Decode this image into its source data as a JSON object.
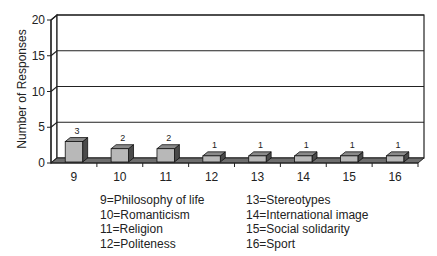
{
  "chart_data": {
    "type": "bar",
    "style": "3d-column",
    "title": "",
    "xlabel": "",
    "ylabel": "Number of Responses",
    "ylim": [
      0,
      20
    ],
    "yticks": [
      0,
      5,
      10,
      15,
      20
    ],
    "grid": true,
    "categories": [
      "9",
      "10",
      "11",
      "12",
      "13",
      "14",
      "15",
      "16"
    ],
    "values": [
      3,
      2,
      2,
      1,
      1,
      1,
      1,
      1
    ],
    "data_labels": [
      "3",
      "2",
      "2",
      "1",
      "1",
      "1",
      "1",
      "1"
    ],
    "legend_position": "bottom",
    "legend": [
      [
        "9=Philosophy of life",
        "10=Romanticism",
        "11=Religion",
        "12=Politeness"
      ],
      [
        "13=Stereotypes",
        "14=International image",
        "15=Social solidarity",
        "16=Sport"
      ]
    ]
  },
  "colors": {
    "bar_front": "#b8b8b8",
    "bar_top": "#8a8a8a",
    "bar_side": "#4a4a4a",
    "floor": "#6e6e6e",
    "axis": "#222222"
  }
}
